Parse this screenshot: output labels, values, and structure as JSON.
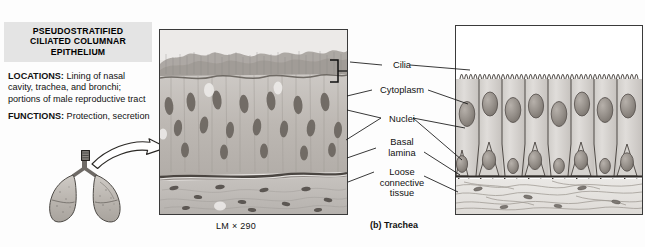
{
  "figure": {
    "tissue_title_lines": [
      "PSEUDOSTRATIFIED",
      "CILIATED COLUMNAR",
      "EPITHELIUM"
    ],
    "locations_lead": "LOCATIONS:",
    "locations_text": " Lining of nasal cavity, trachea, and bronchi; portions of male reproductive tract",
    "functions_lead": "FUNCTIONS:",
    "functions_text": " Protection, secretion",
    "micrograph_caption": "LM × 290",
    "diagram_caption": "(b) Trachea",
    "orientation_icon": "lungs-icon",
    "callout_icon": "curved-arrow-icon"
  },
  "labels": [
    {
      "id": "cilia",
      "text": "Cilia"
    },
    {
      "id": "cytoplasm",
      "text": "Cytoplasm"
    },
    {
      "id": "nuclei",
      "text": "Nuclei"
    },
    {
      "id": "basal_lamina",
      "text": "Basal\nlamina"
    },
    {
      "id": "loose_connective",
      "text": "Loose\nconnective\ntissue"
    }
  ],
  "label_text": {
    "cilia": "Cilia",
    "cytoplasm": "Cytoplasm",
    "nuclei": "Nuclei",
    "basal_lamina_l1": "Basal",
    "basal_lamina_l2": "lamina",
    "loose_l1": "Loose",
    "loose_l2": "connective",
    "loose_l3": "tissue"
  },
  "colors": {
    "title_band": "#e4e4e4",
    "panel_border": "#3a3a3a",
    "leader_line": "#1a1a1a",
    "page_background": "#fdfdfd",
    "cell_fill": "#d9d6d2",
    "nucleus_fill": "#9b958f",
    "connective_fill": "#e8e6e2"
  }
}
